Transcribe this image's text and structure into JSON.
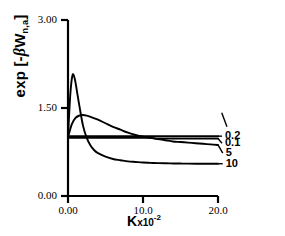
{
  "chart_data": {
    "type": "line",
    "title": "",
    "subtitle": "",
    "xlabel": "K x10-2",
    "xlabel_parts": {
      "symbol": "K",
      "mantissa": "x10",
      "exponent": "-2"
    },
    "ylabel": "exp [-βW n,a]",
    "ylabel_parts": {
      "prefix": "exp [-",
      "beta": "β",
      "var": "W",
      "sub": "n,a",
      "suffix": "]"
    },
    "xlim": [
      0.0,
      20.0
    ],
    "ylim": [
      0.0,
      3.0
    ],
    "xticks": [
      0.0,
      10.0,
      20.0
    ],
    "xticklabels": [
      "0.00",
      "10.0",
      "20.0"
    ],
    "yticks": [
      0.0,
      1.5,
      3.0
    ],
    "yticklabels": [
      "0.00",
      "1.50",
      "3.00"
    ],
    "grid": false,
    "legend_position": "right-of-axes-inline",
    "axis_color": "#000000",
    "curve_color": "#000000",
    "background": "#ffffff",
    "series": [
      {
        "name": "0.2",
        "label": "0.2",
        "label_x": 20.8,
        "label_y": 1.02,
        "leader_from": [
          20.0,
          1.02
        ],
        "x": [
          0.0,
          1.0,
          2.0,
          3.0,
          4.0,
          5.0,
          6.0,
          7.0,
          8.0,
          9.0,
          10.0,
          11.0,
          12.0,
          13.0,
          14.0,
          15.0,
          16.0,
          17.0,
          18.0,
          19.0,
          20.0
        ],
        "y": [
          1.02,
          1.02,
          1.02,
          1.02,
          1.02,
          1.02,
          1.02,
          1.02,
          1.02,
          1.02,
          1.02,
          1.02,
          1.02,
          1.02,
          1.02,
          1.02,
          1.02,
          1.02,
          1.02,
          1.02,
          1.02
        ]
      },
      {
        "name": "0.1",
        "label": "0.1",
        "label_x": 20.8,
        "label_y": 0.9,
        "leader_from": [
          20.0,
          0.98
        ],
        "x": [
          0.0,
          1.0,
          2.0,
          3.0,
          4.0,
          5.0,
          6.0,
          7.0,
          8.0,
          9.0,
          10.0,
          11.0,
          12.0,
          13.0,
          14.0,
          15.0,
          16.0,
          17.0,
          18.0,
          19.0,
          20.0
        ],
        "y": [
          0.99,
          0.99,
          0.99,
          0.99,
          0.99,
          0.99,
          0.99,
          0.99,
          0.99,
          0.99,
          0.99,
          0.99,
          0.98,
          0.98,
          0.98,
          0.98,
          0.98,
          0.98,
          0.98,
          0.98,
          0.98
        ]
      },
      {
        "name": "5",
        "label": "5",
        "label_x": 20.9,
        "label_y": 0.73,
        "leader_from": [
          20.0,
          0.87
        ],
        "x": [
          0.0,
          0.5,
          1.0,
          1.5,
          2.0,
          2.5,
          3.0,
          4.0,
          5.0,
          6.0,
          7.0,
          8.0,
          9.0,
          10.0,
          11.0,
          12.0,
          13.0,
          14.0,
          15.0,
          16.0,
          17.0,
          18.0,
          19.0,
          20.0
        ],
        "y": [
          1.0,
          1.22,
          1.33,
          1.37,
          1.38,
          1.37,
          1.35,
          1.3,
          1.24,
          1.18,
          1.13,
          1.08,
          1.04,
          1.01,
          0.99,
          0.97,
          0.95,
          0.93,
          0.92,
          0.91,
          0.9,
          0.89,
          0.88,
          0.87
        ]
      },
      {
        "name": "10",
        "label": "10",
        "label_x": 20.9,
        "label_y": 0.55,
        "leader_from": [
          20.0,
          0.55
        ],
        "x": [
          0.0,
          0.3,
          0.6,
          0.9,
          1.2,
          1.5,
          2.0,
          2.5,
          3.0,
          3.5,
          4.0,
          5.0,
          6.0,
          7.0,
          8.0,
          9.0,
          10.0,
          11.0,
          12.0,
          13.0,
          14.0,
          15.0,
          16.0,
          17.0,
          18.0,
          19.0,
          20.0
        ],
        "y": [
          1.0,
          1.72,
          2.06,
          2.0,
          1.78,
          1.55,
          1.2,
          0.99,
          0.86,
          0.78,
          0.73,
          0.67,
          0.63,
          0.61,
          0.59,
          0.58,
          0.57,
          0.565,
          0.56,
          0.557,
          0.555,
          0.553,
          0.551,
          0.55,
          0.55,
          0.55,
          0.55
        ]
      }
    ]
  },
  "axes_geometry": {
    "x0_px": 68,
    "x1_px": 218,
    "y0_px": 196,
    "y1_px": 20,
    "tick_len_px": 7
  }
}
